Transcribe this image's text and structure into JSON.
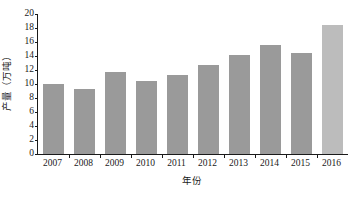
{
  "chart_data": {
    "type": "bar",
    "title": "",
    "xlabel": "年份",
    "ylabel": "产量（万吨）",
    "categories": [
      "2007",
      "2008",
      "2009",
      "2010",
      "2011",
      "2012",
      "2013",
      "2014",
      "2015",
      "2016"
    ],
    "values": [
      10.0,
      9.3,
      11.7,
      10.5,
      11.3,
      12.7,
      14.2,
      15.6,
      14.5,
      18.5
    ],
    "ylim": [
      0,
      20
    ],
    "ytick_labels": [
      "0",
      "2",
      "4",
      "6",
      "8",
      "10",
      "12",
      "14",
      "16",
      "18",
      "20"
    ],
    "ytick_values": [
      0,
      2,
      4,
      6,
      8,
      10,
      12,
      14,
      16,
      18,
      20
    ],
    "grid": false,
    "legend": "none",
    "bar_color": "#9a9a9a",
    "highlight_color": "#bcbcbc",
    "highlight_category": "2016",
    "axis_color": "#1a1a1a"
  }
}
